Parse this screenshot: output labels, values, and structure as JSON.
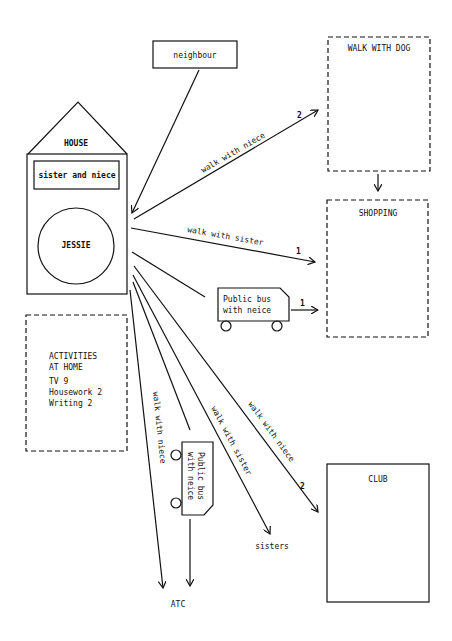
{
  "diagram": {
    "nodes": {
      "neighbour": "neighbour",
      "house": "HOUSE",
      "sister_and_niece": "sister and niece",
      "jessie": "JESSIE",
      "walk_with_dog": "WALK WITH DOG",
      "shopping": "SHOPPING",
      "club": "CLUB",
      "sisters": "sisters",
      "atc": "ATC",
      "bus_right": {
        "line1": "Public bus",
        "line2": "with neice"
      },
      "bus_down": {
        "line1": "Public bus",
        "line2": "with neice"
      },
      "activities": {
        "title1": "ACTIVITIES",
        "title2": "AT HOME",
        "items": [
          "TV 9",
          "Housework 2",
          "Writing 2"
        ]
      }
    },
    "edges": {
      "to_walk_dog": {
        "label": "walk with niece",
        "count": "2"
      },
      "to_shopping_walk": {
        "label": "walk with sister",
        "count": "1"
      },
      "to_shopping_bus": {
        "count": "1"
      },
      "to_club": {
        "label": "walk with niece",
        "count": "2"
      },
      "to_sisters": {
        "label": "walk with sister"
      },
      "to_atc": {
        "label": "walk with niece"
      }
    }
  }
}
